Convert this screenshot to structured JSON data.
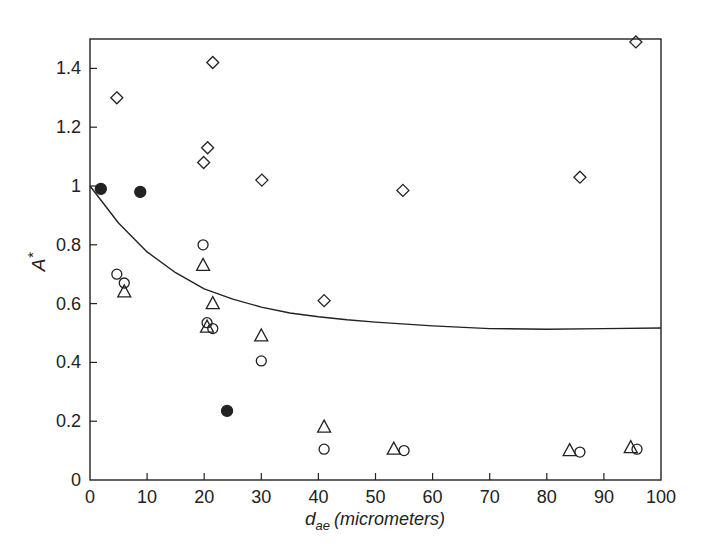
{
  "chart_data": {
    "type": "scatter",
    "title": "",
    "xlabel": "d_ae (micrometers)",
    "xlabel_parts": {
      "symbol": "d",
      "subscript": "ae",
      "unit": "(micrometers)"
    },
    "ylabel": "A*",
    "ylabel_parts": {
      "symbol": "A",
      "superscript": "*"
    },
    "xlim": [
      0,
      100
    ],
    "ylim": [
      0,
      1.5
    ],
    "xticks": [
      0,
      10,
      20,
      30,
      40,
      50,
      60,
      70,
      80,
      90,
      100
    ],
    "xtick_labels": [
      "0",
      "10",
      "20",
      "30",
      "40",
      "50",
      "60",
      "70",
      "80",
      "90",
      "100"
    ],
    "yticks": [
      0,
      0.2,
      0.4,
      0.6,
      0.8,
      1.0,
      1.2,
      1.4
    ],
    "ytick_labels": [
      "0",
      "0.2",
      "0.4",
      "0.6",
      "0.8",
      "1",
      "1.2",
      "1.4"
    ],
    "grid": false,
    "legend": null,
    "series": [
      {
        "name": "diamonds",
        "marker": "diamond-open",
        "points": [
          [
            4.7,
            1.3
          ],
          [
            19.9,
            1.08
          ],
          [
            20.6,
            1.13
          ],
          [
            21.5,
            1.42
          ],
          [
            30.1,
            1.02
          ],
          [
            41.0,
            0.61
          ],
          [
            54.8,
            0.985
          ],
          [
            85.8,
            1.03
          ],
          [
            95.6,
            1.49
          ]
        ]
      },
      {
        "name": "open circles",
        "marker": "circle-open",
        "points": [
          [
            4.7,
            0.7
          ],
          [
            6.0,
            0.67
          ],
          [
            19.8,
            0.8
          ],
          [
            20.5,
            0.535
          ],
          [
            21.5,
            0.515
          ],
          [
            30.0,
            0.405
          ],
          [
            41.0,
            0.105
          ],
          [
            55.0,
            0.1
          ],
          [
            85.8,
            0.095
          ],
          [
            95.8,
            0.105
          ]
        ]
      },
      {
        "name": "triangles",
        "marker": "triangle-open",
        "points": [
          [
            6.0,
            0.64
          ],
          [
            19.8,
            0.73
          ],
          [
            20.5,
            0.52
          ],
          [
            21.5,
            0.6
          ],
          [
            30.0,
            0.49
          ],
          [
            41.0,
            0.18
          ],
          [
            53.2,
            0.105
          ],
          [
            84.0,
            0.1
          ],
          [
            94.7,
            0.11
          ]
        ]
      },
      {
        "name": "filled circles",
        "marker": "circle-filled",
        "points": [
          [
            1.9,
            0.99
          ],
          [
            8.8,
            0.98
          ],
          [
            24.0,
            0.235
          ]
        ]
      },
      {
        "name": "model curve",
        "marker": "line",
        "points": [
          [
            0,
            1.0
          ],
          [
            2,
            0.95
          ],
          [
            5,
            0.874
          ],
          [
            10,
            0.776
          ],
          [
            15,
            0.705
          ],
          [
            20,
            0.65
          ],
          [
            25,
            0.615
          ],
          [
            30,
            0.588
          ],
          [
            35,
            0.568
          ],
          [
            40,
            0.555
          ],
          [
            45,
            0.545
          ],
          [
            50,
            0.537
          ],
          [
            60,
            0.524
          ],
          [
            70,
            0.515
          ],
          [
            80,
            0.513
          ],
          [
            90,
            0.515
          ],
          [
            100,
            0.517
          ]
        ]
      }
    ]
  },
  "colors": {
    "ink": "#222222",
    "background": "#ffffff"
  }
}
